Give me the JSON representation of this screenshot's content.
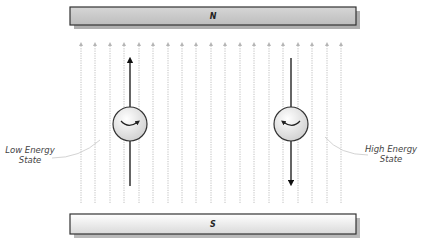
{
  "magnets": {
    "north": {
      "label": "N",
      "fill": "#c8c8c8"
    },
    "south": {
      "label": "S",
      "fill_top": "#ffffff",
      "fill_bottom": "#dcdcdc"
    }
  },
  "field_lines": {
    "count": 19,
    "x_positions": [
      81,
      95,
      110,
      124,
      139,
      153,
      168,
      182,
      196,
      211,
      225,
      240,
      254,
      269,
      283,
      298,
      312,
      327,
      341
    ],
    "direction": "up",
    "color": "#b0b0b0"
  },
  "spins": [
    {
      "id": "low",
      "cx": 130,
      "cy": 124,
      "r": 17,
      "moment_direction": "up",
      "rotation": "clockwise"
    },
    {
      "id": "high",
      "cx": 291,
      "cy": 124,
      "r": 17,
      "moment_direction": "down",
      "rotation": "counterclockwise"
    }
  ],
  "labels": {
    "low_energy_line1": "Low Energy",
    "low_energy_line2": "State",
    "high_energy_line1": "High Energy",
    "high_energy_line2": "State"
  }
}
